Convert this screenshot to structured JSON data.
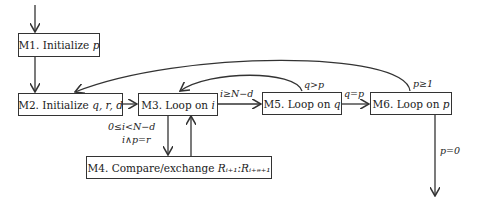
{
  "nodes": {
    "m1": {
      "id": "M1.",
      "text": "Initialize",
      "var": "p"
    },
    "m2": {
      "id": "M2.",
      "text": "Initialize",
      "var": "q, r, d"
    },
    "m3": {
      "id": "M3.",
      "text": "Loop on",
      "var": "i"
    },
    "m4": {
      "id": "M4.",
      "text": "Compare/exchange",
      "var": "Rᵢ₊₁:Rᵢ₊ₔ₊₁"
    },
    "m5": {
      "id": "M5.",
      "text": "Loop on",
      "var": "q"
    },
    "m6": {
      "id": "M6.",
      "text": "Loop on",
      "var": "p"
    }
  },
  "edges": {
    "m3_m5": "i≥N−d",
    "m5_m3": "q>p",
    "m5_m6": "q=p",
    "m6_m2": "p≥1",
    "m3_m4_a": "0≤i<N−d",
    "m3_m4_b": "i∧p=r",
    "m6_exit": "p=0"
  }
}
